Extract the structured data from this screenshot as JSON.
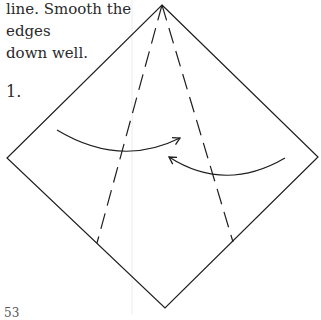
{
  "caption": {
    "line1": "line. Smooth the edges",
    "line2": "down well."
  },
  "step": {
    "number": "1."
  },
  "page": {
    "number": "53"
  },
  "diagram": {
    "square_vertices": {
      "top": [
        162,
        5
      ],
      "right": [
        318,
        157
      ],
      "bottom": [
        165,
        308
      ],
      "left": [
        7,
        158
      ]
    },
    "valley_folds": [
      {
        "from": [
          162,
          5
        ],
        "to": [
          97,
          243
        ]
      },
      {
        "from": [
          162,
          5
        ],
        "to": [
          233,
          242
        ]
      }
    ],
    "arrows": [
      {
        "name": "left-flap-arrow",
        "direction": "toward-center"
      },
      {
        "name": "right-flap-arrow",
        "direction": "toward-center"
      }
    ],
    "colors": {
      "line": "#1e1e1e",
      "gutter": "#e6e6e6"
    }
  }
}
